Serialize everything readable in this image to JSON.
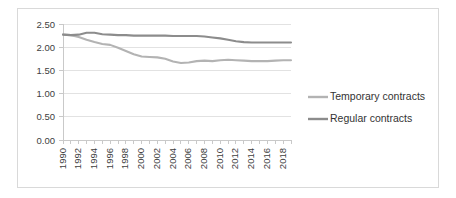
{
  "chart_data": {
    "type": "line",
    "title": "",
    "subtitle": "",
    "xlabel": "",
    "ylabel": "",
    "grid": true,
    "legend_position": "right",
    "ylim": [
      0.0,
      2.5
    ],
    "ytick_labels": [
      "0.00",
      "0.50",
      "1.00",
      "1.50",
      "2.00",
      "2.50"
    ],
    "ytick_values": [
      0.0,
      0.5,
      1.0,
      1.5,
      2.0,
      2.5
    ],
    "x": [
      1990,
      1991,
      1992,
      1993,
      1994,
      1995,
      1996,
      1997,
      1998,
      1999,
      2000,
      2001,
      2002,
      2003,
      2004,
      2005,
      2006,
      2007,
      2008,
      2009,
      2010,
      2011,
      2012,
      2013,
      2014,
      2015,
      2016,
      2017,
      2018,
      2019
    ],
    "xtick_labels": [
      "1990",
      "1992",
      "1994",
      "1996",
      "1998",
      "2000",
      "2002",
      "2004",
      "2006",
      "2008",
      "2010",
      "2012",
      "2014",
      "2016",
      "2018"
    ],
    "xtick_label_values": [
      1990,
      1992,
      1994,
      1996,
      1998,
      2000,
      2002,
      2004,
      2006,
      2008,
      2010,
      2012,
      2014,
      2016,
      2018
    ],
    "xlim": [
      1990,
      2019
    ],
    "series": [
      {
        "name": "Temporary contracts",
        "color": "#b3b3b3",
        "values": [
          2.27,
          2.26,
          2.22,
          2.16,
          2.11,
          2.07,
          2.05,
          1.99,
          1.92,
          1.85,
          1.8,
          1.79,
          1.78,
          1.75,
          1.69,
          1.66,
          1.67,
          1.7,
          1.71,
          1.7,
          1.72,
          1.73,
          1.72,
          1.71,
          1.7,
          1.7,
          1.7,
          1.71,
          1.72,
          1.72
        ]
      },
      {
        "name": "Regular contracts",
        "color": "#8c8c8c",
        "values": [
          2.27,
          2.26,
          2.27,
          2.31,
          2.31,
          2.28,
          2.27,
          2.26,
          2.26,
          2.25,
          2.25,
          2.25,
          2.25,
          2.25,
          2.24,
          2.24,
          2.24,
          2.24,
          2.23,
          2.21,
          2.19,
          2.16,
          2.13,
          2.11,
          2.1,
          2.1,
          2.1,
          2.1,
          2.1,
          2.1
        ]
      }
    ]
  },
  "legend": {
    "items": [
      {
        "label": "Temporary contracts",
        "color": "#b3b3b3"
      },
      {
        "label": "Regular contracts",
        "color": "#8c8c8c"
      }
    ]
  }
}
